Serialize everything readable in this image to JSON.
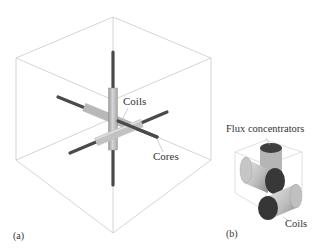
{
  "figure": {
    "panel_a": {
      "id_label": "(a)",
      "callouts": {
        "coils": "Coils",
        "cores": "Cores"
      }
    },
    "panel_b": {
      "id_label": "(b)",
      "callouts": {
        "flux_concentrators": "Flux concentrators",
        "coils": "Coils"
      }
    }
  },
  "colors": {
    "cube_edge": "#c8c8c8",
    "core_dark": "#4a4a4a",
    "coil_light": "#bdbdbd",
    "coil_face_dark": "#3a3a3a",
    "text": "#333333"
  }
}
